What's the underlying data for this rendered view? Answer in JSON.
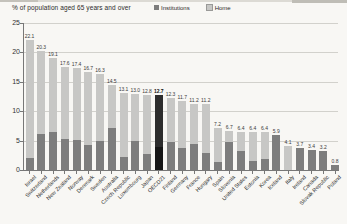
{
  "chart_data": {
    "type": "bar",
    "stacked": true,
    "title": "% of population aged 65 years and over",
    "grid": true,
    "legend_position": "top",
    "ylim": [
      0,
      25
    ],
    "yticks": [
      0,
      5,
      10,
      15,
      20,
      25
    ],
    "categories": [
      "Israel",
      "Switzerland",
      "Netherlands",
      "New Zealand",
      "Norway",
      "Denmark",
      "Sweden",
      "Australia",
      "Czech Republic",
      "Luxembourg",
      "Japan",
      "OECD21",
      "Finland",
      "Germany",
      "France",
      "Hungary",
      "Spain",
      "Slovenia",
      "United States",
      "Estonia",
      "Korea",
      "Iceland",
      "Italy",
      "Ireland",
      "Canada",
      "Slovak Republic",
      "Poland"
    ],
    "totals": [
      22.1,
      20.3,
      19.1,
      17.6,
      17.4,
      16.7,
      16.3,
      14.5,
      13.1,
      13.0,
      12.8,
      12.7,
      12.3,
      11.7,
      11.2,
      11.2,
      7.2,
      6.7,
      6.4,
      6.4,
      6.4,
      5.9,
      4.1,
      3.7,
      3.4,
      3.2,
      0.8
    ],
    "total_labels": [
      "22.1",
      "20.3",
      "19.1",
      "17.6",
      "17.4",
      "16.7",
      "16.3",
      "14.5",
      "13.1",
      "13.0",
      "12.8",
      "12.7",
      "12.3",
      "11.7",
      "11.2",
      "11.2",
      "7.2",
      "6.7",
      "6.4",
      "6.4",
      "6.4",
      "5.9",
      "4.1",
      "3.7",
      "3.4",
      "3.2",
      "0.8"
    ],
    "series": [
      {
        "name": "Institutions",
        "color": "#7d7d7d",
        "values": [
          2.0,
          6.1,
          6.4,
          5.2,
          5.1,
          4.2,
          5.0,
          7.1,
          2.2,
          4.9,
          2.7,
          3.9,
          4.7,
          3.8,
          4.4,
          2.9,
          1.4,
          4.8,
          3.3,
          1.6,
          1.9,
          5.9,
          0.0,
          3.7,
          3.4,
          3.2,
          0.8
        ]
      },
      {
        "name": "Home",
        "color": "#c7c7c5",
        "values": [
          20.1,
          14.2,
          12.7,
          12.4,
          12.3,
          12.5,
          11.3,
          7.4,
          10.9,
          8.1,
          10.1,
          8.8,
          7.6,
          7.9,
          6.8,
          8.3,
          5.8,
          1.9,
          3.1,
          4.8,
          4.5,
          0.0,
          4.1,
          0.0,
          0.0,
          0.0,
          0.0
        ]
      }
    ],
    "highlight_category": "OECD21",
    "highlight_colors": {
      "institutions": "#161616",
      "home": "#2d2d2d"
    },
    "axis_color": "#777777",
    "gridline_color": "#d2d1cc"
  }
}
